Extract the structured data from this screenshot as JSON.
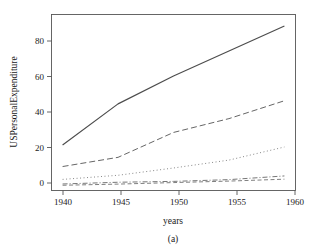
{
  "figure": {
    "caption": "(a)",
    "xlabel": "years",
    "ylabel": "USPersonalExpenditure"
  },
  "axes": {
    "x_ticks": [
      "1940",
      "1945",
      "1950",
      "1955",
      "1960"
    ],
    "y_ticks": [
      "0",
      "20",
      "40",
      "60",
      "80"
    ]
  },
  "chart_data": {
    "type": "line",
    "title": "",
    "subtitle": "",
    "xlabel": "years",
    "ylabel": "USPersonalExpenditure",
    "caption": "(a)",
    "x": [
      1940,
      1945,
      1950,
      1955,
      1960
    ],
    "xlim": [
      1939,
      1961
    ],
    "ylim": [
      -2.5,
      93
    ],
    "x_ticks": [
      1940,
      1945,
      1950,
      1955,
      1960
    ],
    "y_ticks": [
      0,
      20,
      40,
      60,
      80
    ],
    "grid": false,
    "legend": "none",
    "series": [
      {
        "name": "Food and Tobacco",
        "values": [
          22.2,
          44.5,
          59.6,
          73.2,
          86.8
        ],
        "linestyle": "solid",
        "color": "#4d4d4d",
        "width": 1.2
      },
      {
        "name": "Household Operation",
        "values": [
          10.5,
          15.5,
          29.0,
          36.5,
          46.2
        ],
        "linestyle": "dashed",
        "color": "#666666",
        "width": 1.0
      },
      {
        "name": "Medical and Health",
        "values": [
          3.53,
          5.76,
          9.71,
          14.0,
          21.1
        ],
        "linestyle": "dotted",
        "color": "#888888",
        "width": 1.0
      },
      {
        "name": "Personal Care",
        "values": [
          1.04,
          1.98,
          2.45,
          3.4,
          5.4
        ],
        "linestyle": "dashdot",
        "color": "#777777",
        "width": 1.0
      },
      {
        "name": "Private Education",
        "values": [
          0.341,
          0.974,
          1.8,
          2.6,
          3.64
        ],
        "linestyle": "longdash",
        "color": "#808080",
        "width": 1.0
      }
    ]
  }
}
